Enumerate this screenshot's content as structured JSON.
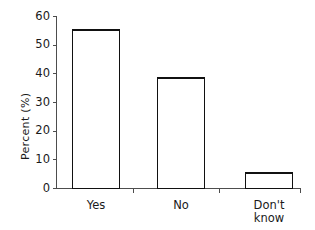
{
  "chart_data": {
    "type": "bar",
    "title": "",
    "subtitle": "",
    "xlabel": "",
    "ylabel": "Percent (%)",
    "categories": [
      "Yes",
      "No",
      "Don't\nknow"
    ],
    "values": [
      55.2,
      38.5,
      5.5
    ],
    "ylim": [
      0,
      60
    ],
    "yticks": [
      0,
      10,
      20,
      30,
      40,
      50,
      60
    ],
    "ytick_labels": [
      "0",
      "10",
      "20",
      "30",
      "40",
      "50",
      "60"
    ],
    "grid": false,
    "legend": false,
    "legend_position": "none",
    "bar_fill_color": "#ffffff",
    "bar_edge_color": "#111111",
    "axis_color": "#4d4d4d",
    "background_color": "#ffffff",
    "annotations": []
  },
  "figure": {
    "width": 315,
    "height": 230
  }
}
